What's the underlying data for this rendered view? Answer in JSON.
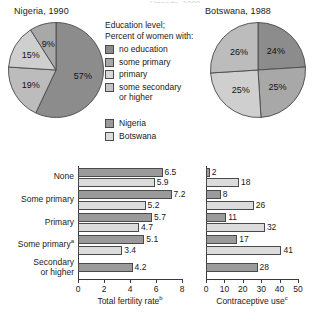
{
  "figure": {
    "cut_caption": "Uganda, 1988",
    "pies": [
      {
        "name": "nigeria-pie",
        "title": "Nigeria, 1990",
        "slices": [
          {
            "label": "no education",
            "value": 57,
            "display": "57%",
            "color": "#8c8c8c"
          },
          {
            "label": "some secondary or higher",
            "value": 19,
            "display": "19%",
            "color": "#bcbcbc"
          },
          {
            "label": "primary",
            "value": 15,
            "display": "15%",
            "color": "#cfcfcf"
          },
          {
            "label": "some primary",
            "value": 9,
            "display": "9%",
            "color": "#a8a8a8"
          }
        ]
      },
      {
        "name": "botswana-pie",
        "title": "Botswana, 1988",
        "slices": [
          {
            "label": "no education",
            "value": 24,
            "display": "24%",
            "color": "#8c8c8c"
          },
          {
            "label": "some primary",
            "value": 25,
            "display": "25%",
            "color": "#a8a8a8"
          },
          {
            "label": "primary",
            "value": 25,
            "display": "25%",
            "color": "#cfcfcf"
          },
          {
            "label": "some secondary or higher",
            "value": 26,
            "display": "26%",
            "color": "#bcbcbc"
          }
        ]
      }
    ],
    "legend": {
      "heading_line1": "Education level;",
      "heading_line2": "Percent of women with:",
      "items": [
        {
          "label": "no education",
          "color": "#8c8c8c"
        },
        {
          "label": "some primary",
          "color": "#a8a8a8"
        },
        {
          "label": "primary",
          "color": "#d8d8d8"
        },
        {
          "label": "some secondary or higher",
          "color": "#c4c4c4"
        }
      ],
      "countries": [
        {
          "label": "Nigeria",
          "color": "#9a9a9a"
        },
        {
          "label": "Botswana",
          "color": "#dcdcdc"
        }
      ]
    }
  },
  "chart_data": [
    {
      "name": "total-fertility-rate-chart",
      "type": "bar",
      "orientation": "horizontal",
      "title": "",
      "xlabel": "Total fertility rate",
      "xlabel_sup": "b",
      "ylabel": "",
      "categories": [
        "None",
        "Some primary",
        "Primary",
        "Some primary",
        "Secondary or higher"
      ],
      "category_sups": [
        "",
        "",
        "",
        "a",
        ""
      ],
      "series": [
        {
          "name": "Nigeria",
          "color": "#9a9a9a",
          "values": [
            6.5,
            7.2,
            5.7,
            5.1,
            4.2
          ]
        },
        {
          "name": "Botswana",
          "color": "#dcdcdc",
          "values": [
            5.9,
            5.2,
            4.7,
            3.4,
            null
          ]
        }
      ],
      "xlim": [
        0,
        8
      ],
      "xticks": [
        0,
        2,
        4,
        6,
        8
      ],
      "xticklabels": [
        "0",
        "2",
        "4",
        "6",
        "8"
      ],
      "grid": false,
      "legend_position": "above"
    },
    {
      "name": "contraceptive-use-chart",
      "type": "bar",
      "orientation": "horizontal",
      "title": "",
      "xlabel": "Contraceptive use",
      "xlabel_sup": "c",
      "ylabel": "",
      "categories": [
        "None",
        "Some primary",
        "Primary",
        "Some primary",
        "Secondary or higher"
      ],
      "category_sups": [
        "",
        "",
        "",
        "a",
        ""
      ],
      "series": [
        {
          "name": "Nigeria",
          "color": "#9a9a9a",
          "values": [
            2,
            8,
            11,
            17,
            28
          ]
        },
        {
          "name": "Botswana",
          "color": "#dcdcdc",
          "values": [
            18,
            26,
            32,
            41,
            null
          ]
        }
      ],
      "xlim": [
        0,
        50
      ],
      "xticks": [
        0,
        10,
        20,
        30,
        40,
        50
      ],
      "xticklabels": [
        "0",
        "10",
        "20",
        "30",
        "40",
        "50"
      ],
      "grid": false,
      "legend_position": "above"
    }
  ]
}
